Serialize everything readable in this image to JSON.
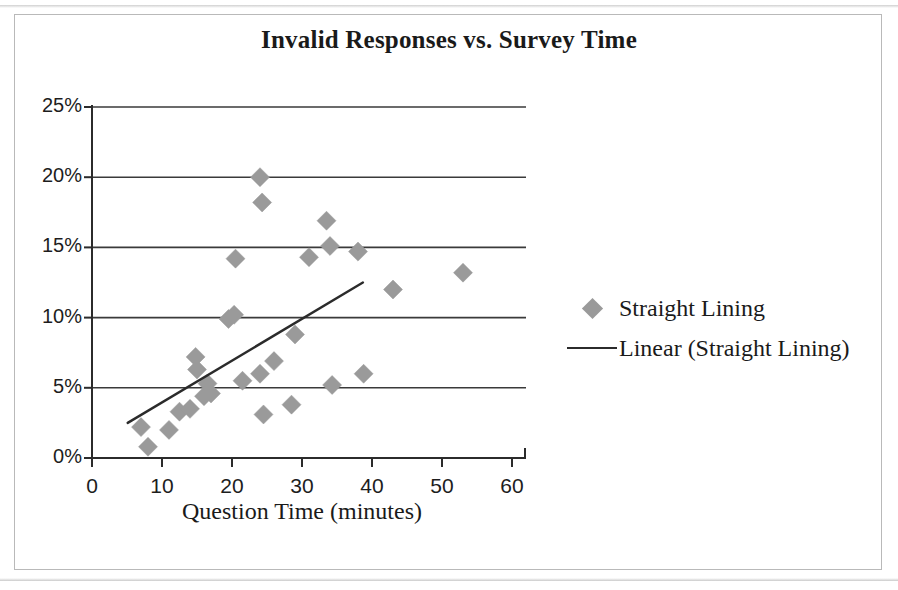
{
  "chart_data": {
    "type": "scatter",
    "title": "Invalid Responses vs. Survey Time",
    "xlabel": "Question Time (minutes)",
    "ylabel": "",
    "xlim": [
      0,
      60
    ],
    "ylim": [
      0,
      25
    ],
    "xticks": [
      "0",
      "10",
      "20",
      "30",
      "40",
      "50",
      "60"
    ],
    "yticks": [
      "0%",
      "5%",
      "10%",
      "15%",
      "20%",
      "25%"
    ],
    "grid": "horizontal",
    "legend_position": "right",
    "marker_color": "#9a9a9a",
    "trendline_color": "#2b2b2b",
    "series": [
      {
        "name": "Straight Lining",
        "marker": "diamond",
        "points": [
          {
            "x": 7.0,
            "y": 2.2
          },
          {
            "x": 8.0,
            "y": 0.8
          },
          {
            "x": 11.0,
            "y": 2.0
          },
          {
            "x": 12.5,
            "y": 3.3
          },
          {
            "x": 14.0,
            "y": 3.5
          },
          {
            "x": 14.8,
            "y": 7.2
          },
          {
            "x": 15.0,
            "y": 6.3
          },
          {
            "x": 16.0,
            "y": 4.4
          },
          {
            "x": 16.5,
            "y": 5.3
          },
          {
            "x": 17.0,
            "y": 4.6
          },
          {
            "x": 19.5,
            "y": 9.9
          },
          {
            "x": 20.3,
            "y": 10.2
          },
          {
            "x": 20.5,
            "y": 14.2
          },
          {
            "x": 21.5,
            "y": 5.5
          },
          {
            "x": 24.0,
            "y": 20.0
          },
          {
            "x": 24.0,
            "y": 6.0
          },
          {
            "x": 24.3,
            "y": 18.2
          },
          {
            "x": 24.5,
            "y": 3.1
          },
          {
            "x": 26.0,
            "y": 6.9
          },
          {
            "x": 28.5,
            "y": 3.8
          },
          {
            "x": 29.0,
            "y": 8.8
          },
          {
            "x": 31.0,
            "y": 14.3
          },
          {
            "x": 33.5,
            "y": 16.9
          },
          {
            "x": 34.0,
            "y": 15.1
          },
          {
            "x": 34.3,
            "y": 5.2
          },
          {
            "x": 38.0,
            "y": 14.7
          },
          {
            "x": 38.8,
            "y": 6.0
          },
          {
            "x": 43.0,
            "y": 12.0
          },
          {
            "x": 53.0,
            "y": 13.2
          }
        ]
      }
    ],
    "trendline": {
      "name": "Linear (Straight Lining)",
      "x_start": 5.1,
      "y_start": 2.5,
      "x_end": 38.7,
      "y_end": 12.5
    },
    "legend": [
      {
        "label": "Straight Lining",
        "key": "diamond-marker"
      },
      {
        "label": "Linear (Straight Lining)",
        "key": "trend-line"
      }
    ]
  }
}
